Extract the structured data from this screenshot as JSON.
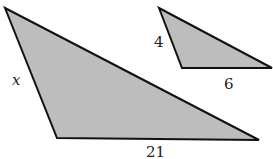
{
  "figure": {
    "fill_color": "#bdbdbd",
    "stroke_color": "#111111",
    "large_triangle": {
      "points": "5,8 57,138 259,140",
      "labels": {
        "side_left": {
          "text": "x",
          "x": 12,
          "y": 85
        },
        "side_bottom": {
          "text": "21",
          "x": 146,
          "y": 157
        }
      }
    },
    "small_triangle": {
      "points": "159,8 182,68 272,68",
      "labels": {
        "side_left": {
          "text": "4",
          "x": 154,
          "y": 47
        },
        "side_bottom": {
          "text": "6",
          "x": 224,
          "y": 89
        }
      }
    }
  }
}
